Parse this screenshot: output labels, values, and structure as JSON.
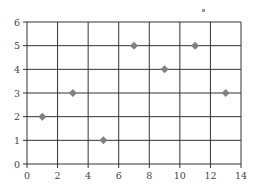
{
  "chart_data": {
    "type": "scatter",
    "title": "",
    "xlabel": "",
    "ylabel": "",
    "xlim": [
      0,
      14
    ],
    "ylim": [
      0,
      6
    ],
    "x_ticks": [
      0,
      2,
      4,
      6,
      8,
      10,
      12,
      14
    ],
    "y_ticks": [
      0,
      1,
      2,
      3,
      4,
      5,
      6
    ],
    "grid": true,
    "legend": null,
    "series": [
      {
        "name": "points",
        "marker": "diamond",
        "color": "#808080",
        "points": [
          {
            "x": 1,
            "y": 2
          },
          {
            "x": 3,
            "y": 3
          },
          {
            "x": 5,
            "y": 1
          },
          {
            "x": 7,
            "y": 5
          },
          {
            "x": 9,
            "y": 4
          },
          {
            "x": 11,
            "y": 5
          },
          {
            "x": 13,
            "y": 3
          }
        ]
      }
    ]
  },
  "colors": {
    "grid": "#333333",
    "marker": "#808080",
    "tick_text": "#444444"
  }
}
